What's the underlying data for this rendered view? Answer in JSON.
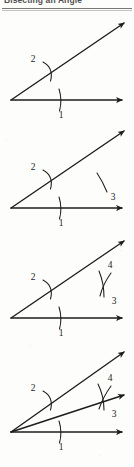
{
  "document": {
    "title": "Bisecting an Angle",
    "page_background": "#fdfdfc",
    "ink_color": "#1c1c1c"
  },
  "figure": {
    "caption": "Bisecting an Angle",
    "step_count": 4,
    "steps": [
      {
        "index": 1,
        "name": "draw-angle-and-first-arc",
        "description": "An angle is drawn with two rays from a common vertex; an arc centered at the vertex crosses both rays.",
        "labels": [
          {
            "text": "1",
            "target": "arc-crossing-horizontal-ray"
          },
          {
            "text": "2",
            "target": "arc-crossing-upper-ray"
          }
        ],
        "rays": [
          "horizontal-ray",
          "upper-ray"
        ]
      },
      {
        "index": 2,
        "name": "first-interior-arc",
        "description": "A compass arc is struck from the intersection point on the horizontal ray into the interior of the angle.",
        "labels": [
          {
            "text": "1",
            "target": "arc-crossing-horizontal-ray"
          },
          {
            "text": "2",
            "target": "arc-crossing-upper-ray"
          },
          {
            "text": "3",
            "target": "interior-arc-from-lower-point"
          }
        ],
        "rays": [
          "horizontal-ray",
          "upper-ray"
        ]
      },
      {
        "index": 3,
        "name": "second-interior-arc",
        "description": "A second arc is struck from the intersection point on the upper ray, crossing the first interior arc.",
        "labels": [
          {
            "text": "1",
            "target": "arc-crossing-horizontal-ray"
          },
          {
            "text": "2",
            "target": "arc-crossing-upper-ray"
          },
          {
            "text": "3",
            "target": "interior-arc-from-lower-point"
          },
          {
            "text": "4",
            "target": "interior-arc-from-upper-point"
          }
        ],
        "rays": [
          "horizontal-ray",
          "upper-ray"
        ]
      },
      {
        "index": 4,
        "name": "draw-bisector",
        "description": "A ray is drawn from the vertex through the crossing point of the two interior arcs, bisecting the angle.",
        "labels": [
          {
            "text": "1",
            "target": "arc-crossing-horizontal-ray"
          },
          {
            "text": "2",
            "target": "arc-crossing-upper-ray"
          },
          {
            "text": "3",
            "target": "interior-arc-from-lower-point"
          },
          {
            "text": "4",
            "target": "interior-arc-from-upper-point"
          }
        ],
        "rays": [
          "horizontal-ray",
          "upper-ray",
          "bisector-ray"
        ]
      }
    ]
  }
}
